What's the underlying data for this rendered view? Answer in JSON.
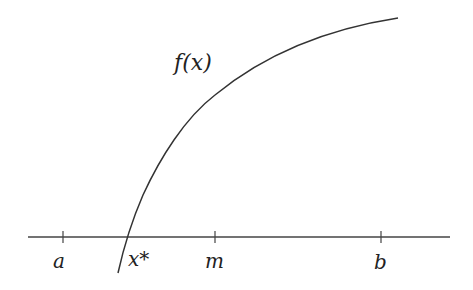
{
  "diagram": {
    "curve_label": "f(x)",
    "axis_points": [
      {
        "id": "a",
        "label": "a",
        "x": 63
      },
      {
        "id": "m",
        "label": "m",
        "x": 215
      },
      {
        "id": "b",
        "label": "b",
        "x": 381
      }
    ],
    "root_label": "x*",
    "colors": {
      "stroke": "#333333",
      "text": "#222222",
      "background": "#ffffff"
    }
  }
}
